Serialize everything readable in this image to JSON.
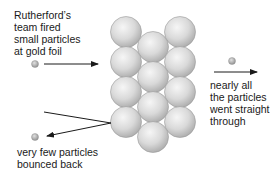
{
  "diagram": {
    "labels": {
      "incoming": [
        "Rutherford’s",
        "team fired",
        "small particles",
        "at gold foil"
      ],
      "through": [
        "nearly all",
        "the particles",
        "went straight",
        "through"
      ],
      "bounced": [
        "very few particles",
        "bounced back"
      ]
    },
    "colors": {
      "atom_fill": "#d8d8d8",
      "atom_stroke": "#9a9a9a",
      "particle_fill": "#b0b0b0",
      "arrow": "#1a1a1a",
      "text": "#1a1a1a"
    },
    "atoms": [
      {
        "cx": 126,
        "cy": 32
      },
      {
        "cx": 180,
        "cy": 32
      },
      {
        "cx": 153,
        "cy": 47
      },
      {
        "cx": 126,
        "cy": 62
      },
      {
        "cx": 180,
        "cy": 62
      },
      {
        "cx": 153,
        "cy": 77
      },
      {
        "cx": 126,
        "cy": 92
      },
      {
        "cx": 180,
        "cy": 92
      },
      {
        "cx": 153,
        "cy": 107
      },
      {
        "cx": 126,
        "cy": 122
      },
      {
        "cx": 180,
        "cy": 122
      },
      {
        "cx": 153,
        "cy": 137
      }
    ],
    "particles": [
      {
        "name": "incoming-particle",
        "cx": 35,
        "cy": 64
      },
      {
        "name": "through-particle",
        "cx": 232,
        "cy": 61
      },
      {
        "name": "bounced-particle",
        "cx": 35,
        "cy": 137
      }
    ]
  }
}
